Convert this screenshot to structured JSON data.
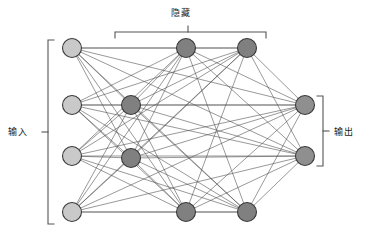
{
  "diagram": {
    "title_hidden": "隐藏",
    "title_input": "输入",
    "title_output": "输出",
    "colors": {
      "input_node_fill": "#c9c9c9",
      "hidden_node_fill": "#808080",
      "output_node_fill": "#8f8f8f",
      "node_stroke": "#3a3a3a",
      "edge": "#4a4a4a",
      "bracket": "#555555",
      "background": "#ffffff"
    },
    "node_radius": 9.5,
    "layers": [
      {
        "name": "input",
        "label": "输入",
        "kind": "input",
        "nodes": [
          {
            "id": "i1",
            "x": 72,
            "y": 48
          },
          {
            "id": "i2",
            "x": 72,
            "y": 105
          },
          {
            "id": "i3",
            "x": 72,
            "y": 156
          },
          {
            "id": "i4",
            "x": 72,
            "y": 212
          }
        ]
      },
      {
        "name": "hidden-1",
        "label": "隐藏",
        "kind": "hidden",
        "nodes": [
          {
            "id": "h1",
            "x": 131,
            "y": 105
          },
          {
            "id": "h2",
            "x": 131,
            "y": 158
          }
        ]
      },
      {
        "name": "hidden-2",
        "label": "隐藏",
        "kind": "hidden",
        "nodes": [
          {
            "id": "h3",
            "x": 186,
            "y": 48
          },
          {
            "id": "h4",
            "x": 186,
            "y": 212
          }
        ]
      },
      {
        "name": "hidden-3",
        "label": "隐藏",
        "kind": "hidden",
        "nodes": [
          {
            "id": "h5",
            "x": 247,
            "y": 48
          },
          {
            "id": "h6",
            "x": 247,
            "y": 212
          }
        ]
      },
      {
        "name": "output",
        "label": "输出",
        "kind": "output",
        "nodes": [
          {
            "id": "o1",
            "x": 305,
            "y": 105
          },
          {
            "id": "o2",
            "x": 305,
            "y": 156
          }
        ]
      }
    ],
    "edge_groups": [
      {
        "from": [
          "i1",
          "i2",
          "i3",
          "i4"
        ],
        "to": [
          "h1",
          "h2"
        ]
      },
      {
        "from": [
          "i1",
          "i2",
          "i3",
          "i4"
        ],
        "to": [
          "h3",
          "h4"
        ]
      },
      {
        "from": [
          "i1",
          "i2",
          "i3",
          "i4"
        ],
        "to": [
          "h5",
          "h6"
        ]
      },
      {
        "from": [
          "h1",
          "h2"
        ],
        "to": [
          "h3",
          "h4"
        ]
      },
      {
        "from": [
          "h1",
          "h2"
        ],
        "to": [
          "h5",
          "h6"
        ]
      },
      {
        "from": [
          "h3",
          "h4"
        ],
        "to": [
          "h5",
          "h6"
        ]
      },
      {
        "from": [
          "h1",
          "h2"
        ],
        "to": [
          "o1",
          "o2"
        ]
      },
      {
        "from": [
          "h3",
          "h4"
        ],
        "to": [
          "o1",
          "o2"
        ]
      },
      {
        "from": [
          "h5",
          "h6"
        ],
        "to": [
          "o1",
          "o2"
        ]
      },
      {
        "from": [
          "i1"
        ],
        "to": [
          "o1",
          "o2"
        ]
      },
      {
        "from": [
          "i2"
        ],
        "to": [
          "o1",
          "o2"
        ]
      },
      {
        "from": [
          "i3"
        ],
        "to": [
          "o1",
          "o2"
        ]
      },
      {
        "from": [
          "i4"
        ],
        "to": [
          "o1",
          "o2"
        ]
      }
    ],
    "brackets": {
      "input": {
        "orientation": "vertical-left",
        "x": 48,
        "y1": 40,
        "y2": 224,
        "tick": 132,
        "cap": 6
      },
      "hidden": {
        "orientation": "horizontal-top",
        "y": 32,
        "x1": 115,
        "x2": 266,
        "tick": 188,
        "cap": 6
      },
      "output": {
        "orientation": "vertical-right",
        "x": 323,
        "y1": 96,
        "y2": 166,
        "tick": 131,
        "cap": 6
      }
    }
  }
}
